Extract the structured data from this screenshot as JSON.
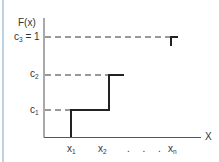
{
  "diagram": {
    "type": "step-cdf",
    "y_axis_label": "F(x)",
    "x_axis_label": "X",
    "y_levels": [
      {
        "id": "c1",
        "label": "c",
        "subscript": "1",
        "suffix": ""
      },
      {
        "id": "c2",
        "label": "c",
        "subscript": "2",
        "suffix": ""
      },
      {
        "id": "c3",
        "label": "c",
        "subscript": "3",
        "suffix": " = 1"
      }
    ],
    "x_ticks": [
      {
        "label": "x",
        "subscript": "1"
      },
      {
        "label": "x",
        "subscript": "2"
      },
      {
        "label": "x",
        "subscript": "n"
      }
    ],
    "ellipsis": ". . .",
    "colors": {
      "line": "#222222",
      "axis": "#555555",
      "dash": "#333333",
      "border": "#bcd3e6"
    }
  }
}
